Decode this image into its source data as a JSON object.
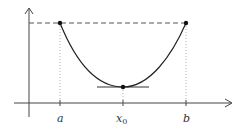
{
  "diagram": {
    "labels": {
      "a": "a",
      "x0_main": "x",
      "x0_sub": "0",
      "b": "b"
    },
    "colors": {
      "axis": "#444444",
      "curve": "#222222",
      "dashed": "#555555",
      "dotted": "#999999",
      "point": "#111111"
    },
    "points": [
      {
        "name": "left-endpoint",
        "x": 60,
        "y": 23
      },
      {
        "name": "right-endpoint",
        "x": 186,
        "y": 23
      },
      {
        "name": "minimum",
        "x": 123,
        "y": 87
      }
    ]
  }
}
